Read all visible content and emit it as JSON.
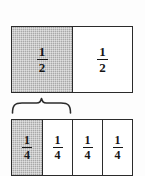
{
  "figure": {
    "background_color": "#fdfdfd",
    "line_color": "#2b2b2b",
    "shade_color": "#a9a9a9",
    "text_color": "#161616",
    "halves_bar": {
      "label": "halves-bar",
      "cells": [
        {
          "numerator": "1",
          "denominator": "2",
          "shaded": true
        },
        {
          "numerator": "1",
          "denominator": "2",
          "shaded": false
        }
      ]
    },
    "brace": {
      "label": "curly-brace",
      "spans_cells": "2",
      "orientation": "up"
    },
    "quarters_bar": {
      "label": "quarters-bar",
      "cells": [
        {
          "numerator": "1",
          "denominator": "4",
          "shaded": true
        },
        {
          "numerator": "1",
          "denominator": "4",
          "shaded": false
        },
        {
          "numerator": "1",
          "denominator": "4",
          "shaded": false
        },
        {
          "numerator": "1",
          "denominator": "4",
          "shaded": false
        }
      ]
    }
  }
}
